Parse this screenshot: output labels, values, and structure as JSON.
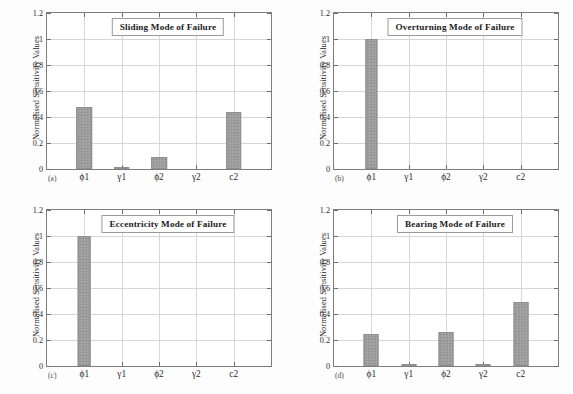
{
  "figure": {
    "background": "#fdfdfd",
    "bar_color": "#9d9d9d",
    "grid_color": "#d6d6d6",
    "axis_color": "#7d7d7d"
  },
  "chart_data": [
    {
      "type": "bar",
      "panel": "(a)",
      "title": "Sliding Mode of Failure",
      "categories": [
        "ϕ1",
        "γ1",
        "ϕ2",
        "γ2",
        "c2"
      ],
      "values": [
        0.48,
        0.005,
        0.09,
        0.0,
        0.44
      ],
      "xlabel": "",
      "ylabel": "Normalised Sensitivity Values",
      "ylim": [
        0,
        1.2
      ],
      "yticks": [
        "0",
        "0.2",
        "0.4",
        "0.6",
        "0.8",
        "1",
        "1.2"
      ],
      "ytick_values": [
        0,
        0.2,
        0.4,
        0.6,
        0.8,
        1,
        1.2
      ],
      "grid": true,
      "legend": "none",
      "bar_width": 0.42
    },
    {
      "type": "bar",
      "panel": "(b)",
      "title": "Overturning Mode of Failure",
      "categories": [
        "ϕ1",
        "γ1",
        "ϕ2",
        "γ2",
        "c2"
      ],
      "values": [
        1.0,
        0.0,
        0.0,
        0.0,
        0.0
      ],
      "xlabel": "",
      "ylabel": "Normalised Sensitivity Values",
      "ylim": [
        0,
        1.2
      ],
      "yticks": [
        "0",
        "0.2",
        "0.4",
        "0.6",
        "0.8",
        "1",
        "1.2"
      ],
      "ytick_values": [
        0,
        0.2,
        0.4,
        0.6,
        0.8,
        1,
        1.2
      ],
      "grid": true,
      "legend": "none",
      "bar_width": 0.3
    },
    {
      "type": "bar",
      "panel": "(c)",
      "title": "Eccentricity Mode of Failure",
      "categories": [
        "ϕ1",
        "γ1",
        "ϕ2",
        "γ2",
        "c2"
      ],
      "values": [
        1.0,
        0.0,
        0.0,
        0.0,
        0.0
      ],
      "xlabel": "",
      "ylabel": "Normalised Sensitivity Values",
      "ylim": [
        0,
        1.2
      ],
      "yticks": [
        "0",
        "0.2",
        "0.4",
        "0.6",
        "0.8",
        "1",
        "1.2"
      ],
      "ytick_values": [
        0,
        0.2,
        0.4,
        0.6,
        0.8,
        1,
        1.2
      ],
      "grid": true,
      "legend": "none",
      "bar_width": 0.34
    },
    {
      "type": "bar",
      "panel": "(d)",
      "title": "Bearing Mode of Failure",
      "categories": [
        "ϕ1",
        "γ1",
        "ϕ2",
        "γ2",
        "c2"
      ],
      "values": [
        0.245,
        0.005,
        0.265,
        0.005,
        0.49
      ],
      "xlabel": "",
      "ylabel": "Normalised Sensitivity Values",
      "ylim": [
        0,
        1.2
      ],
      "yticks": [
        "0",
        "0.2",
        "0.4",
        "0.6",
        "0.8",
        "1",
        "1.2"
      ],
      "ytick_values": [
        0,
        0.2,
        0.4,
        0.6,
        0.8,
        1,
        1.2
      ],
      "grid": true,
      "legend": "none",
      "bar_width": 0.4
    }
  ]
}
